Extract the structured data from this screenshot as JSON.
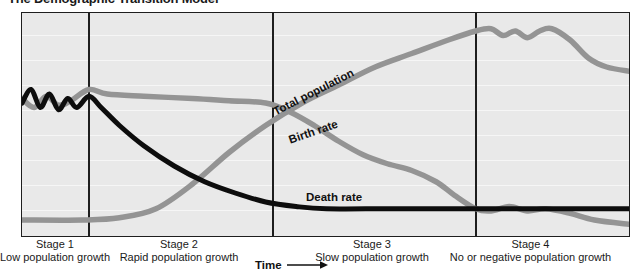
{
  "title": "The Demographic Transition Model",
  "axis": {
    "x_label": "Time",
    "arrow_icon": "right-arrow-icon"
  },
  "curve_labels": {
    "total_population": "Total population",
    "birth_rate": "Birth rate",
    "death_rate": "Death rate"
  },
  "stages": [
    {
      "name": "Stage 1",
      "description": "Low population growth"
    },
    {
      "name": "Stage 2",
      "description": "Rapid population growth"
    },
    {
      "name": "Stage 3",
      "description": "Slow population growth"
    },
    {
      "name": "Stage 4",
      "description": "No or negative population growth"
    }
  ],
  "colors": {
    "plot_background": "#e9e9e9",
    "gridline": "#f6f6f6",
    "frame": "#1e1e1e",
    "gray_curve": "#949494",
    "black_curve": "#0d0d0d",
    "text": "#1a1a1a"
  },
  "chart_data": {
    "type": "line",
    "title": "The Demographic Transition Model",
    "xlabel": "Time",
    "ylabel": "",
    "grid": true,
    "legend": "inline-curve-labels",
    "xlim": [
      0,
      100
    ],
    "ylim": [
      0,
      100
    ],
    "stage_boundaries": [
      11,
      41.2,
      74.5
    ],
    "series": [
      {
        "name": "Birth rate",
        "color": "#949494",
        "points": [
          [
            0,
            62
          ],
          [
            2,
            58
          ],
          [
            4,
            63
          ],
          [
            6,
            59
          ],
          [
            8,
            61
          ],
          [
            11,
            66
          ],
          [
            14,
            64
          ],
          [
            20,
            63
          ],
          [
            28,
            62
          ],
          [
            34,
            61
          ],
          [
            40,
            60
          ],
          [
            44,
            56
          ],
          [
            48,
            50
          ],
          [
            52,
            43
          ],
          [
            56,
            37
          ],
          [
            60,
            33
          ],
          [
            64,
            30
          ],
          [
            68,
            25
          ],
          [
            71,
            19
          ],
          [
            74.5,
            13
          ],
          [
            77,
            12
          ],
          [
            80,
            14
          ],
          [
            83,
            12
          ],
          [
            86,
            13
          ],
          [
            90,
            11
          ],
          [
            94,
            8
          ],
          [
            100,
            6
          ]
        ]
      },
      {
        "name": "Death rate",
        "color": "#0d0d0d",
        "points": [
          [
            0,
            60
          ],
          [
            1.5,
            66
          ],
          [
            3,
            58
          ],
          [
            4.5,
            64
          ],
          [
            6,
            57
          ],
          [
            7.5,
            62
          ],
          [
            9,
            58
          ],
          [
            11,
            63
          ],
          [
            13,
            58
          ],
          [
            16,
            50
          ],
          [
            20,
            41
          ],
          [
            25,
            32
          ],
          [
            30,
            25
          ],
          [
            35,
            20
          ],
          [
            40,
            16
          ],
          [
            45,
            14
          ],
          [
            50,
            13
          ],
          [
            60,
            13
          ],
          [
            70,
            13
          ],
          [
            80,
            13
          ],
          [
            90,
            13
          ],
          [
            100,
            13
          ]
        ]
      },
      {
        "name": "Total population",
        "color": "#949494",
        "points": [
          [
            0,
            8
          ],
          [
            10,
            8
          ],
          [
            16,
            9
          ],
          [
            22,
            13
          ],
          [
            28,
            24
          ],
          [
            34,
            38
          ],
          [
            40,
            50
          ],
          [
            46,
            60
          ],
          [
            52,
            68
          ],
          [
            58,
            76
          ],
          [
            64,
            82
          ],
          [
            70,
            88
          ],
          [
            74.5,
            92
          ],
          [
            77,
            93
          ],
          [
            79,
            90
          ],
          [
            81,
            92
          ],
          [
            83,
            89
          ],
          [
            85,
            92
          ],
          [
            87,
            93
          ],
          [
            90,
            88
          ],
          [
            93,
            80
          ],
          [
            96,
            76
          ],
          [
            100,
            74
          ]
        ]
      }
    ]
  }
}
